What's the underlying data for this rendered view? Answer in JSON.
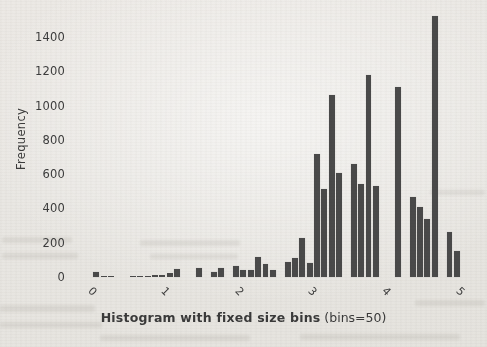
{
  "page": {
    "background": "#e9e7e3",
    "text_color": "#3c3c3c"
  },
  "chart_data": {
    "type": "bar",
    "subtype": "histogram",
    "title_bold": "Histogram with fixed size bins",
    "title_suffix": " (bins=50)",
    "title_full": "Histogram with fixed size bins (bins=50)",
    "xlabel": "",
    "ylabel": "Frequency",
    "bar_color": "#4a4a4a",
    "grid": false,
    "legend": null,
    "bin_start": 0.0,
    "bin_width": 0.1,
    "n_bins": 50,
    "xlim": [
      -0.3,
      5.3
    ],
    "ylim": [
      0,
      1550
    ],
    "xticks": [
      0,
      1,
      2,
      3,
      4,
      5
    ],
    "yticks": [
      0,
      200,
      400,
      600,
      800,
      1000,
      1200,
      1400
    ],
    "values": [
      30,
      8,
      5,
      0,
      0,
      5,
      5,
      8,
      12,
      12,
      25,
      45,
      0,
      0,
      50,
      0,
      30,
      55,
      0,
      65,
      40,
      40,
      115,
      75,
      40,
      0,
      85,
      110,
      225,
      80,
      720,
      515,
      1060,
      605,
      0,
      660,
      540,
      1180,
      530,
      0,
      0,
      1110,
      0,
      465,
      410,
      340,
      1520,
      0,
      260,
      150
    ]
  }
}
